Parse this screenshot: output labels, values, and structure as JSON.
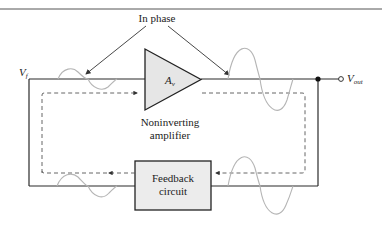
{
  "title_annotation": "In phase",
  "amplifier": {
    "symbol": "A",
    "symbol_sub": "v",
    "caption_line1": "Noninverting",
    "caption_line2": "amplifier",
    "fill": "#e6e6e6"
  },
  "feedback": {
    "line1": "Feedback",
    "line2": "circuit",
    "fill": "#ececec"
  },
  "input_label": {
    "main": "V",
    "sub": "f"
  },
  "output_label": {
    "main": "V",
    "sub": "out"
  },
  "colors": {
    "wire": "#2b2b2b",
    "signal_wave": "#b5b5b5",
    "dashed_loop": "#555555"
  }
}
